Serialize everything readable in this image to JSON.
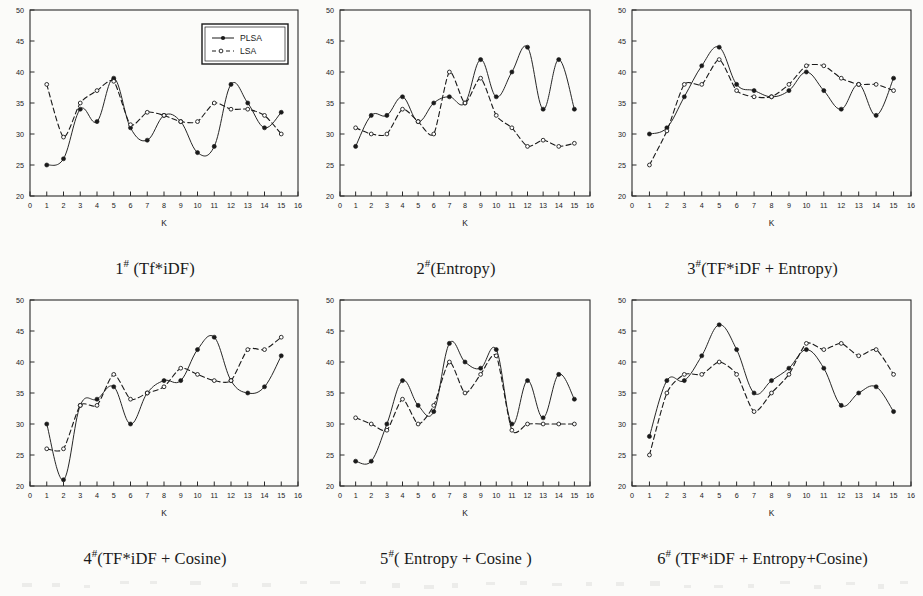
{
  "figure": {
    "axis_label_x": "K",
    "legend": {
      "series1": "PLSA",
      "series2": "LSA"
    },
    "colors": {
      "ink": "#1a1a1a",
      "paper": "#ffffff",
      "axis": "#2b2b2b"
    }
  },
  "captions": {
    "p1_num": "1",
    "p1_hash": "#",
    "p1_text": " (Tf*iDF)",
    "p2_num": "2",
    "p2_hash": "#",
    "p2_text": "(Entropy)",
    "p3_num": "3",
    "p3_hash": "#",
    "p3_text": "(TF*iDF + Entropy)",
    "p4_num": "4",
    "p4_hash": "#",
    "p4_text": "(TF*iDF + Cosine)",
    "p5_num": "5",
    "p5_hash": "#",
    "p5_text": "( Entropy + Cosine )",
    "p6_num": "6",
    "p6_hash": "#",
    "p6_text": " (TF*iDF + Entropy+Cosine)"
  },
  "chart_data": [
    {
      "type": "line",
      "title": "1# (Tf*iDF)",
      "xlabel": "K",
      "ylabel": "",
      "xlim": [
        0,
        16
      ],
      "ylim": [
        20,
        50
      ],
      "xticks": [
        0,
        1,
        2,
        3,
        4,
        5,
        6,
        7,
        8,
        9,
        10,
        11,
        12,
        13,
        14,
        15,
        16
      ],
      "yticks": [
        20,
        25,
        30,
        35,
        40,
        45,
        50
      ],
      "grid": false,
      "legend_position": "top-right",
      "x": [
        1,
        2,
        3,
        4,
        5,
        6,
        7,
        8,
        9,
        10,
        11,
        12,
        13,
        14,
        15
      ],
      "series": [
        {
          "name": "PLSA",
          "style": "solid",
          "marker": "filled-circle",
          "values": [
            25,
            26,
            34,
            32,
            39,
            31,
            29,
            33,
            32,
            27,
            28,
            38,
            35,
            31,
            33.5
          ]
        },
        {
          "name": "LSA",
          "style": "dashed",
          "marker": "open-circle",
          "values": [
            38,
            29.5,
            35,
            37,
            38.5,
            31.5,
            33.5,
            33,
            32,
            32,
            35,
            34,
            34,
            33,
            30
          ]
        }
      ]
    },
    {
      "type": "line",
      "title": "2#(Entropy)",
      "xlabel": "K",
      "ylabel": "",
      "xlim": [
        0,
        16
      ],
      "ylim": [
        20,
        50
      ],
      "xticks": [
        0,
        1,
        2,
        3,
        4,
        5,
        6,
        7,
        8,
        9,
        10,
        11,
        12,
        13,
        14,
        15,
        16
      ],
      "yticks": [
        20,
        25,
        30,
        35,
        40,
        45,
        50
      ],
      "grid": false,
      "legend_position": "none",
      "x": [
        1,
        2,
        3,
        4,
        5,
        6,
        7,
        8,
        9,
        10,
        11,
        12,
        13,
        14,
        15
      ],
      "series": [
        {
          "name": "PLSA",
          "style": "solid",
          "marker": "filled-circle",
          "values": [
            28,
            33,
            33,
            36,
            32,
            35,
            36,
            35,
            42,
            36,
            40,
            44,
            34,
            42,
            34
          ]
        },
        {
          "name": "LSA",
          "style": "dashed",
          "marker": "open-circle",
          "values": [
            31,
            30,
            30,
            34,
            32,
            30,
            40,
            35,
            39,
            33,
            31,
            28,
            29,
            28,
            28.5
          ]
        }
      ]
    },
    {
      "type": "line",
      "title": "3#(TF*iDF + Entropy)",
      "xlabel": "K",
      "ylabel": "",
      "xlim": [
        0,
        16
      ],
      "ylim": [
        20,
        50
      ],
      "xticks": [
        0,
        1,
        2,
        3,
        4,
        5,
        6,
        7,
        8,
        9,
        10,
        11,
        12,
        13,
        14,
        15,
        16
      ],
      "yticks": [
        20,
        25,
        30,
        35,
        40,
        45,
        50
      ],
      "grid": false,
      "legend_position": "none",
      "x": [
        1,
        2,
        3,
        4,
        5,
        6,
        7,
        8,
        9,
        10,
        11,
        12,
        13,
        14,
        15
      ],
      "series": [
        {
          "name": "PLSA",
          "style": "solid",
          "marker": "filled-circle",
          "values": [
            30,
            31,
            36,
            41,
            44,
            38,
            37,
            36,
            37,
            40,
            37,
            34,
            38,
            33,
            39
          ]
        },
        {
          "name": "LSA",
          "style": "dashed",
          "marker": "open-circle",
          "values": [
            25,
            30.5,
            38,
            38,
            42,
            37,
            36,
            36,
            38,
            41,
            41,
            39,
            38,
            38,
            37
          ]
        }
      ]
    },
    {
      "type": "line",
      "title": "4#(TF*iDF + Cosine)",
      "xlabel": "K",
      "ylabel": "",
      "xlim": [
        0,
        16
      ],
      "ylim": [
        20,
        50
      ],
      "xticks": [
        0,
        1,
        2,
        3,
        4,
        5,
        6,
        7,
        8,
        9,
        10,
        11,
        12,
        13,
        14,
        15,
        16
      ],
      "yticks": [
        20,
        25,
        30,
        35,
        40,
        45,
        50
      ],
      "grid": false,
      "legend_position": "none",
      "x": [
        1,
        2,
        3,
        4,
        5,
        6,
        7,
        8,
        9,
        10,
        11,
        12,
        13,
        14,
        15
      ],
      "series": [
        {
          "name": "PLSA",
          "style": "solid",
          "marker": "filled-circle",
          "values": [
            30,
            21,
            33,
            34,
            36,
            30,
            35,
            37,
            37,
            42,
            44,
            37,
            35,
            36,
            41
          ]
        },
        {
          "name": "LSA",
          "style": "dashed",
          "marker": "open-circle",
          "values": [
            26,
            26,
            33,
            33,
            38,
            34,
            35,
            36,
            39,
            38,
            37,
            37,
            42,
            42,
            44
          ]
        }
      ]
    },
    {
      "type": "line",
      "title": "5#( Entropy + Cosine )",
      "xlabel": "K",
      "ylabel": "",
      "xlim": [
        0,
        16
      ],
      "ylim": [
        20,
        50
      ],
      "xticks": [
        0,
        1,
        2,
        3,
        4,
        5,
        6,
        7,
        8,
        9,
        10,
        11,
        12,
        13,
        14,
        15,
        16
      ],
      "yticks": [
        20,
        25,
        30,
        35,
        40,
        45,
        50
      ],
      "grid": false,
      "legend_position": "none",
      "x": [
        1,
        2,
        3,
        4,
        5,
        6,
        7,
        8,
        9,
        10,
        11,
        12,
        13,
        14,
        15
      ],
      "series": [
        {
          "name": "PLSA",
          "style": "solid",
          "marker": "filled-circle",
          "values": [
            24,
            24,
            30,
            37,
            33,
            32,
            43,
            40,
            39,
            42,
            30,
            37,
            31,
            38,
            34
          ]
        },
        {
          "name": "LSA",
          "style": "dashed",
          "marker": "open-circle",
          "values": [
            31,
            30,
            29,
            34,
            30,
            33,
            40,
            35,
            38,
            41,
            29,
            30,
            30,
            30,
            30
          ]
        }
      ]
    },
    {
      "type": "line",
      "title": "6# (TF*iDF + Entropy+Cosine)",
      "xlabel": "K",
      "ylabel": "",
      "xlim": [
        0,
        16
      ],
      "ylim": [
        20,
        50
      ],
      "xticks": [
        0,
        1,
        2,
        3,
        4,
        5,
        6,
        7,
        8,
        9,
        10,
        11,
        12,
        13,
        14,
        15,
        16
      ],
      "yticks": [
        20,
        25,
        30,
        35,
        40,
        45,
        50
      ],
      "grid": false,
      "legend_position": "none",
      "x": [
        1,
        2,
        3,
        4,
        5,
        6,
        7,
        8,
        9,
        10,
        11,
        12,
        13,
        14,
        15
      ],
      "series": [
        {
          "name": "PLSA",
          "style": "solid",
          "marker": "filled-circle",
          "values": [
            28,
            37,
            37,
            41,
            46,
            42,
            35,
            37,
            39,
            42,
            39,
            33,
            35,
            36,
            32
          ]
        },
        {
          "name": "LSA",
          "style": "dashed",
          "marker": "open-circle",
          "values": [
            25,
            35,
            38,
            38,
            40,
            38,
            32,
            35,
            38,
            43,
            42,
            43,
            41,
            42,
            38
          ]
        }
      ]
    }
  ]
}
